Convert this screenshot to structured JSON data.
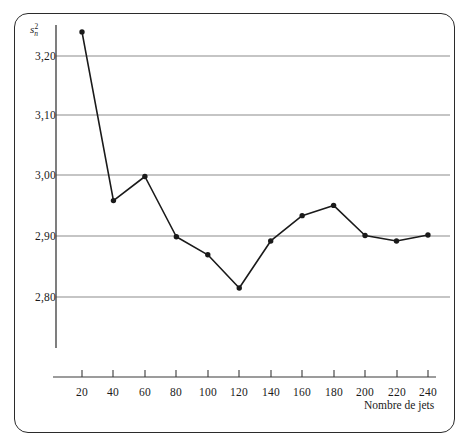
{
  "chart_data": {
    "type": "line",
    "title": "",
    "subtitle": "",
    "xlabel": "Nombre de jets",
    "ylabel": "s²",
    "ylabel_parts": {
      "base": "s",
      "subscript": "n",
      "superscript": "2"
    },
    "x": [
      20,
      40,
      60,
      80,
      100,
      120,
      140,
      160,
      180,
      200,
      220,
      240
    ],
    "values": [
      3.24,
      2.96,
      3.0,
      2.9,
      2.87,
      2.815,
      2.893,
      2.935,
      2.952,
      2.902,
      2.893,
      2.903
    ],
    "series": [
      {
        "name": "variance",
        "values": [
          3.24,
          2.96,
          3.0,
          2.9,
          2.87,
          2.815,
          2.893,
          2.935,
          2.952,
          2.902,
          2.893,
          2.903
        ]
      }
    ],
    "xlim": [
      0,
      260
    ],
    "ylim": [
      2.74,
      3.28
    ],
    "xticks": [
      20,
      40,
      60,
      80,
      100,
      120,
      140,
      160,
      180,
      200,
      220,
      240
    ],
    "xtick_labels": [
      "20",
      "40",
      "60",
      "80",
      "100",
      "120",
      "140",
      "160",
      "180",
      "200",
      "220",
      "240"
    ],
    "yticks": [
      2.8,
      2.9,
      3.0,
      3.1,
      3.2
    ],
    "ytick_labels": [
      "2,80",
      "2,90",
      "3,00",
      "3,10",
      "3,20"
    ],
    "grid": "horizontal",
    "legend": "none",
    "marker": "filled-circle",
    "line_color": "#1a1a1a",
    "grid_color": "#8c8c8c",
    "axis_color": "#3a3a3a",
    "background_color": "#ffffff",
    "frame_color": "#2b2b2b"
  }
}
